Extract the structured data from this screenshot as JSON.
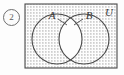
{
  "item": {
    "number": "2"
  },
  "figure": {
    "name": "venn-diagram",
    "universal_set_label": "U",
    "set_a_label": "A",
    "set_b_label": "B",
    "shading_note": "everything inside U is stippled except the lens A∩B which is left white",
    "colors": {
      "outline": "#4a4a4a",
      "stipple": "#8c8c8c",
      "background": "#fdfdfd",
      "unshaded": "#ffffff",
      "label": "#3a3a3a"
    },
    "geometry": {
      "rect": {
        "x": 1,
        "y": 1,
        "w": 92,
        "h": 64
      },
      "circle_a": {
        "cx": 33,
        "cy": 36,
        "r": 25
      },
      "circle_b": {
        "cx": 60,
        "cy": 36,
        "r": 25
      },
      "label_a_pos": {
        "x": 29,
        "y": 14
      },
      "label_b_pos": {
        "x": 62,
        "y": 14
      },
      "label_u_pos": {
        "x": 84,
        "y": 12
      }
    }
  }
}
